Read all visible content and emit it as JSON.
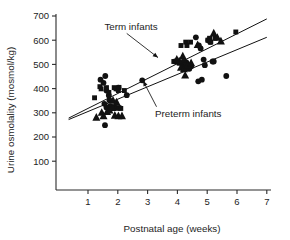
{
  "chart_data": {
    "type": "scatter",
    "title": "",
    "xlabel": "Postnatal age (weeks)",
    "ylabel": "Urine osmolality (mosmol/kg)",
    "xlim": [
      0.35,
      7.0
    ],
    "ylim": [
      40,
      720
    ],
    "xticks": [
      1,
      2,
      3,
      4,
      5,
      6,
      7
    ],
    "xticklabels": [
      "1",
      "2",
      "3",
      "4",
      "5",
      "6",
      "7"
    ],
    "yticks": [
      100,
      200,
      300,
      400,
      500,
      600,
      700
    ],
    "yticklabels": [
      "100",
      "200",
      "300",
      "400",
      "500",
      "600",
      "700"
    ],
    "grid": false,
    "legend_position": "none",
    "annotations": [
      {
        "text": "Term infants",
        "text_x": 1.55,
        "text_y": 655,
        "arrow_from_x": 2.3,
        "arrow_from_y": 628,
        "arrow_to_x": 3.35,
        "arrow_to_y": 528
      },
      {
        "text": "Preterm infants",
        "text_x": 3.25,
        "text_y": 295,
        "arrow_from_x": 3.3,
        "arrow_from_y": 325,
        "arrow_to_x": 2.85,
        "arrow_to_y": 432
      }
    ],
    "fit_lines": [
      {
        "name": "Term infants regression",
        "x0": 0.35,
        "y0": 278,
        "x1": 7.0,
        "y1": 688
      },
      {
        "name": "Preterm infants regression",
        "x0": 0.35,
        "y0": 272,
        "x1": 7.0,
        "y1": 612
      }
    ],
    "series": [
      {
        "name": "circle-points",
        "marker": "circle",
        "points": [
          [
            1.42,
            437
          ],
          [
            1.58,
            452
          ],
          [
            1.52,
            424
          ],
          [
            1.62,
            392
          ],
          [
            1.7,
            372
          ],
          [
            1.72,
            352
          ],
          [
            1.55,
            337
          ],
          [
            1.62,
            322
          ],
          [
            1.74,
            327
          ],
          [
            1.88,
            322
          ],
          [
            1.96,
            320
          ],
          [
            2.06,
            320
          ],
          [
            1.57,
            249
          ],
          [
            1.98,
            399
          ],
          [
            2.02,
            404
          ],
          [
            2.3,
            373
          ],
          [
            2.82,
            434
          ],
          [
            3.92,
            512
          ],
          [
            4.08,
            508
          ],
          [
            4.3,
            508
          ],
          [
            4.18,
            497
          ],
          [
            4.38,
            497
          ],
          [
            4.46,
            492
          ],
          [
            4.4,
            482
          ],
          [
            4.62,
            612
          ],
          [
            4.72,
            578
          ],
          [
            4.78,
            566
          ],
          [
            4.88,
            520
          ],
          [
            4.92,
            497
          ],
          [
            4.82,
            437
          ],
          [
            4.7,
            430
          ],
          [
            5.04,
            600
          ],
          [
            5.1,
            593
          ],
          [
            5.18,
            512
          ],
          [
            5.22,
            512
          ],
          [
            5.64,
            452
          ]
        ]
      },
      {
        "name": "square-points",
        "marker": "square",
        "points": [
          [
            1.22,
            362
          ],
          [
            1.4,
            408
          ],
          [
            1.44,
            399
          ],
          [
            1.62,
            404
          ],
          [
            1.7,
            384
          ],
          [
            1.88,
            404
          ],
          [
            1.94,
            399
          ],
          [
            2.02,
            392
          ],
          [
            2.04,
            405
          ],
          [
            2.1,
            318
          ],
          [
            2.22,
            392
          ],
          [
            3.88,
            512
          ],
          [
            3.96,
            512
          ],
          [
            4.06,
            505
          ],
          [
            4.22,
            512
          ],
          [
            4.26,
            497
          ],
          [
            4.3,
            482
          ],
          [
            4.12,
            578
          ],
          [
            4.28,
            592
          ],
          [
            4.32,
            578
          ],
          [
            4.44,
            592
          ],
          [
            5.02,
            600
          ],
          [
            5.08,
            608
          ],
          [
            5.12,
            592
          ],
          [
            5.26,
            608
          ],
          [
            5.96,
            634
          ]
        ]
      },
      {
        "name": "triangle-points",
        "marker": "triangle",
        "points": [
          [
            1.28,
            282
          ],
          [
            1.46,
            302
          ],
          [
            1.52,
            288
          ],
          [
            1.64,
            305
          ],
          [
            1.72,
            312
          ],
          [
            1.82,
            322
          ],
          [
            1.9,
            290
          ],
          [
            2.02,
            288
          ],
          [
            2.14,
            288
          ],
          [
            1.84,
            352
          ],
          [
            1.96,
            345
          ],
          [
            3.98,
            522
          ],
          [
            4.06,
            515
          ],
          [
            4.18,
            535
          ],
          [
            4.12,
            488
          ],
          [
            4.22,
            482
          ],
          [
            4.34,
            497
          ],
          [
            4.26,
            456
          ],
          [
            4.46,
            507
          ],
          [
            4.68,
            582
          ],
          [
            5.22,
            630
          ],
          [
            5.34,
            612
          ],
          [
            5.46,
            597
          ]
        ]
      }
    ]
  }
}
